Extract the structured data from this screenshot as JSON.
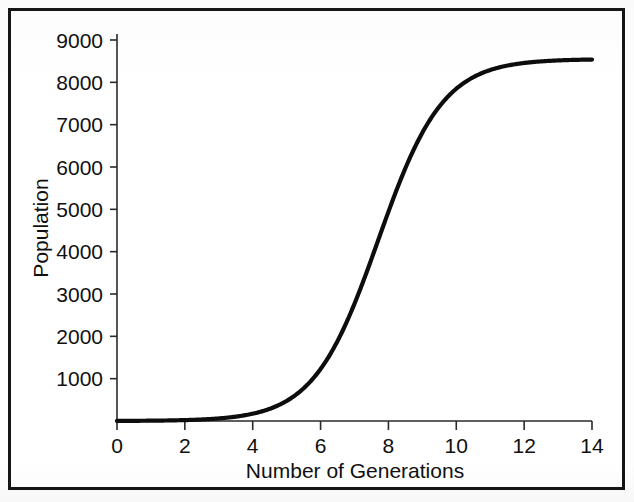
{
  "figure": {
    "border_color": "#151515",
    "background_color": "#ffffff"
  },
  "chart_data": {
    "type": "line",
    "title": "",
    "xlabel": "Number of Generations",
    "ylabel": "Population",
    "xlim": [
      0,
      14
    ],
    "ylim": [
      0,
      9000
    ],
    "xticks": [
      0,
      2,
      4,
      6,
      8,
      10,
      12,
      14
    ],
    "yticks": [
      1000,
      2000,
      3000,
      4000,
      5000,
      6000,
      7000,
      8000,
      9000
    ],
    "xtick_labels": [
      "0",
      "2",
      "4",
      "6",
      "8",
      "10",
      "12",
      "14"
    ],
    "ytick_labels": [
      "1000",
      "2000",
      "3000",
      "4000",
      "5000",
      "6000",
      "7000",
      "8000",
      "9000"
    ],
    "grid": false,
    "legend": null,
    "line_color": "#0d0d0d",
    "carrying_capacity": 8550,
    "inflection_generation": 7.7,
    "growth_rate": 1.05,
    "x": [
      0,
      0.5,
      1,
      1.5,
      2,
      2.5,
      3,
      3.5,
      4,
      4.5,
      5,
      5.5,
      6,
      6.5,
      7,
      7.5,
      8,
      8.5,
      9,
      9.5,
      10,
      10.5,
      11,
      11.5,
      12,
      12.5,
      13,
      13.5,
      14
    ],
    "y": [
      26,
      44,
      74,
      124,
      208,
      347,
      574,
      939,
      1511,
      2357,
      3497,
      4850,
      6218,
      7352,
      8097,
      8465,
      8604,
      8641,
      8650,
      8652,
      8653,
      8653,
      8653,
      8653,
      8653,
      8653,
      8653,
      8653,
      8653
    ],
    "series": [
      {
        "name": "Population",
        "x": [
          0,
          0.5,
          1,
          1.5,
          2,
          2.5,
          3,
          3.5,
          4,
          4.5,
          5,
          5.5,
          6,
          6.5,
          7,
          7.5,
          8,
          8.5,
          9,
          9.5,
          10,
          10.5,
          11,
          11.5,
          12,
          12.5,
          13,
          13.5,
          14
        ],
        "values": [
          26,
          44,
          74,
          124,
          208,
          347,
          574,
          939,
          1511,
          2357,
          3497,
          4850,
          6218,
          7352,
          8097,
          8465,
          8604,
          8641,
          8650,
          8652,
          8653,
          8653,
          8653,
          8653,
          8653,
          8653,
          8653,
          8653,
          8653
        ]
      }
    ]
  }
}
